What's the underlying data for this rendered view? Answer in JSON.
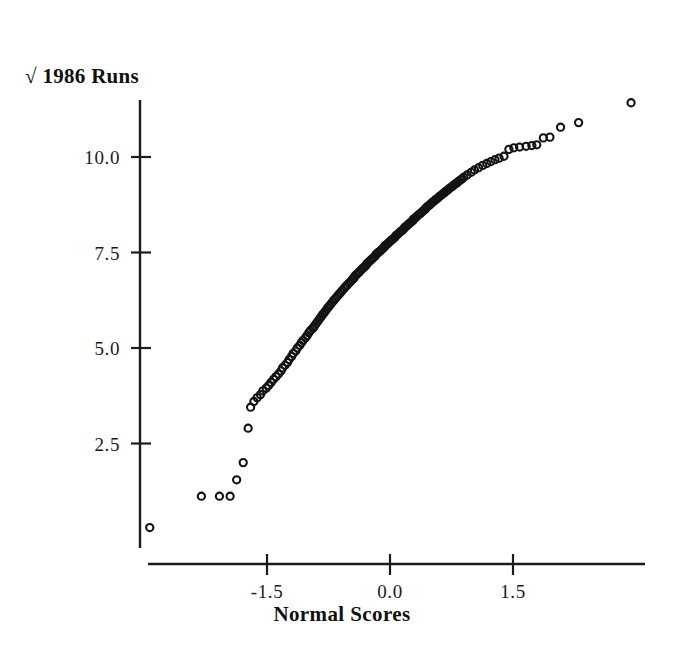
{
  "chart_data": {
    "type": "scatter",
    "title": "",
    "xlabel": "Normal Scores",
    "ylabel": "√ 1986 Runs",
    "ylabel_plain": "sqrt 1986 Runs",
    "xlim": [
      -3.3,
      3.3
    ],
    "ylim": [
      0.0,
      12.2
    ],
    "xticks": [
      -1.5,
      0.0,
      1.5
    ],
    "xticklabels": [
      "-1.5",
      "0.0",
      "1.5"
    ],
    "yticks": [
      2.5,
      5.0,
      7.5,
      10.0
    ],
    "yticklabels": [
      "2.5",
      "5.0",
      "7.5",
      "10.0"
    ],
    "grid": false,
    "legend": null,
    "marker": "open-circle",
    "marker_color": "#131313",
    "axis_color": "#1c1c1c",
    "background": "#ffffff",
    "n_points": 152,
    "x": [
      -2.93,
      -2.3,
      -2.08,
      -1.95,
      -1.87,
      -1.79,
      -1.73,
      -1.7,
      -1.66,
      -1.62,
      -1.58,
      -1.55,
      -1.51,
      -1.48,
      -1.45,
      -1.42,
      -1.39,
      -1.36,
      -1.33,
      -1.31,
      -1.28,
      -1.25,
      -1.23,
      -1.2,
      -1.18,
      -1.15,
      -1.13,
      -1.1,
      -1.08,
      -1.06,
      -1.03,
      -1.01,
      -0.99,
      -0.97,
      -0.94,
      -0.92,
      -0.9,
      -0.88,
      -0.86,
      -0.84,
      -0.82,
      -0.8,
      -0.78,
      -0.76,
      -0.74,
      -0.72,
      -0.7,
      -0.68,
      -0.66,
      -0.64,
      -0.62,
      -0.6,
      -0.58,
      -0.56,
      -0.54,
      -0.52,
      -0.5,
      -0.48,
      -0.46,
      -0.44,
      -0.43,
      -0.41,
      -0.39,
      -0.37,
      -0.35,
      -0.33,
      -0.31,
      -0.29,
      -0.28,
      -0.26,
      -0.24,
      -0.22,
      -0.2,
      -0.18,
      -0.17,
      -0.15,
      -0.13,
      -0.11,
      -0.09,
      -0.07,
      -0.06,
      -0.04,
      -0.02,
      0.0,
      0.02,
      0.04,
      0.06,
      0.07,
      0.09,
      0.11,
      0.13,
      0.15,
      0.17,
      0.18,
      0.2,
      0.22,
      0.24,
      0.26,
      0.28,
      0.29,
      0.31,
      0.33,
      0.35,
      0.37,
      0.39,
      0.41,
      0.43,
      0.44,
      0.46,
      0.48,
      0.5,
      0.52,
      0.54,
      0.56,
      0.58,
      0.6,
      0.62,
      0.64,
      0.66,
      0.68,
      0.7,
      0.72,
      0.74,
      0.76,
      0.78,
      0.8,
      0.82,
      0.84,
      0.86,
      0.88,
      0.9,
      0.94,
      0.99,
      1.03,
      1.08,
      1.13,
      1.18,
      1.23,
      1.28,
      1.33,
      1.39,
      1.45,
      1.51,
      1.58,
      1.66,
      1.73,
      1.79,
      1.87,
      1.95,
      2.08,
      2.3,
      2.94
    ],
    "y": [
      0.3,
      1.12,
      1.12,
      1.12,
      1.55,
      2.0,
      2.9,
      3.45,
      3.6,
      3.7,
      3.78,
      3.88,
      3.95,
      4.02,
      4.1,
      4.18,
      4.25,
      4.32,
      4.4,
      4.48,
      4.55,
      4.62,
      4.7,
      4.78,
      4.86,
      4.92,
      5.0,
      5.07,
      5.14,
      5.2,
      5.27,
      5.33,
      5.4,
      5.46,
      5.52,
      5.58,
      5.64,
      5.7,
      5.76,
      5.82,
      5.88,
      5.93,
      5.99,
      6.05,
      6.1,
      6.15,
      6.21,
      6.26,
      6.31,
      6.36,
      6.41,
      6.46,
      6.51,
      6.56,
      6.61,
      6.65,
      6.7,
      6.74,
      6.79,
      6.83,
      6.88,
      6.92,
      6.96,
      7.0,
      7.05,
      7.09,
      7.13,
      7.17,
      7.21,
      7.25,
      7.29,
      7.33,
      7.37,
      7.41,
      7.45,
      7.49,
      7.52,
      7.56,
      7.6,
      7.64,
      7.68,
      7.71,
      7.75,
      7.79,
      7.83,
      7.86,
      7.9,
      7.94,
      7.97,
      8.01,
      8.05,
      8.08,
      8.12,
      8.16,
      8.19,
      8.23,
      8.27,
      8.3,
      8.34,
      8.38,
      8.41,
      8.45,
      8.49,
      8.52,
      8.56,
      8.6,
      8.63,
      8.67,
      8.71,
      8.74,
      8.78,
      8.82,
      8.85,
      8.89,
      8.92,
      8.96,
      8.99,
      9.03,
      9.06,
      9.1,
      9.13,
      9.17,
      9.2,
      9.23,
      9.27,
      9.3,
      9.33,
      9.37,
      9.4,
      9.43,
      9.47,
      9.53,
      9.6,
      9.66,
      9.72,
      9.78,
      9.83,
      9.88,
      9.93,
      9.97,
      10.02,
      10.2,
      10.24,
      10.26,
      10.28,
      10.3,
      10.32,
      10.5,
      10.52,
      10.78,
      10.9,
      11.42
    ]
  },
  "figure": {
    "y_axis_title": "√ 1986 Runs",
    "x_axis_title": "Normal Scores",
    "y_tick_labels": [
      "10.0",
      "7.5",
      "5.0",
      "2.5"
    ],
    "x_tick_labels": [
      "-1.5",
      "0.0",
      "1.5"
    ]
  }
}
